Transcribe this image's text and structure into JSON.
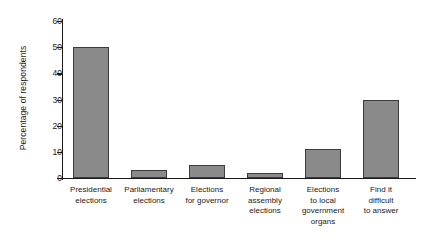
{
  "chart_data": {
    "type": "bar",
    "title": "",
    "xlabel": "",
    "ylabel": "Percentage of respondents",
    "ylim": [
      0,
      60
    ],
    "yticks": [
      0,
      10,
      20,
      30,
      40,
      50,
      60
    ],
    "grid": false,
    "legend": "none",
    "categories": [
      "Presidential\nelections",
      "Parliamentary\nelections",
      "Elections\nfor governor",
      "Regional\nassembly\nelections",
      "Elections\nto local\ngovernment\norgans",
      "Find it\ndifficult\nto answer"
    ],
    "values": [
      50,
      3,
      5,
      2,
      11,
      30
    ],
    "bar_color": "#8a8a8a",
    "bar_edge_color": "#3c3c3c",
    "axis_color": "#1a1a1a",
    "background_color": "#ffffff"
  }
}
